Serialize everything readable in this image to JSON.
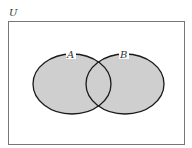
{
  "diagram": {
    "type": "venn",
    "universe_label": "U",
    "sets": [
      {
        "label": "A",
        "shaded": true
      },
      {
        "label": "B",
        "shaded": true
      }
    ],
    "shaded_region": "A ∪ B",
    "colors": {
      "fill": "#cfcfcf",
      "stroke": "#1a1a1a",
      "border": "#777777",
      "background": "#ffffff"
    }
  }
}
